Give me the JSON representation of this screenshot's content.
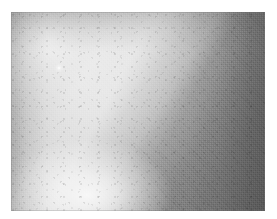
{
  "document": {
    "kind": "grayscale-radiographic-image",
    "width_px": 277,
    "height_px": 219,
    "background_color": "#ffffff",
    "alt_text": ""
  },
  "plate": {
    "label": "",
    "left_px": 11,
    "top_px": 12,
    "width_px": 254,
    "height_px": 199,
    "colorspace": "grayscale",
    "base_color": "#8e8e8e"
  },
  "regions": [
    {
      "name": "upper-right-dark-mass",
      "description": "Coarse mid-to-dark gray textured tissue filling the upper-right triangle",
      "tone_hex": "#7e7e7e"
    },
    {
      "name": "bright-wedge",
      "description": "Bright wedge-shaped beam radiating from an apex near the upper-left toward the lower centre",
      "tone_hex": "#e6e6e6"
    },
    {
      "name": "lower-left-bright-pool",
      "description": "Near-white high-intensity pool at the lower-left centre",
      "tone_hex": "#f2f2f2"
    },
    {
      "name": "left-margin-band",
      "description": "Medium gray band along the left edge",
      "tone_hex": "#9c9c9c"
    },
    {
      "name": "right-edge-falloff",
      "description": "Vertical darkening band along the far right edge",
      "tone_hex": "#767676"
    },
    {
      "name": "top-edge-falloff",
      "description": "Darker horizontal band along the top edge",
      "tone_hex": "#858585"
    }
  ],
  "markers": [
    {
      "name": "bright-speck",
      "description": "Small high-intensity point (calcification-like speck) inside the bright wedge",
      "x_px": 59,
      "y_px": 68,
      "diameter_px": 4,
      "tone_hex": "#ffffff"
    }
  ],
  "texture": {
    "name": "film-grain-halftone",
    "description": "Fine halftone / scanning grain overlaid across the whole plate"
  }
}
